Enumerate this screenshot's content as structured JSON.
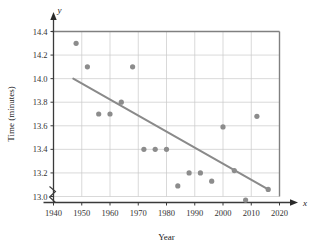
{
  "chart_data": {
    "type": "scatter",
    "title": "",
    "xlabel": "Year",
    "ylabel": "Time (minutes)",
    "x_axis_letter": "x",
    "y_axis_letter": "y",
    "xlim": [
      1940,
      2020
    ],
    "ylim": [
      13.0,
      14.4
    ],
    "xticks": [
      1940,
      1950,
      1960,
      1970,
      1980,
      1990,
      2000,
      2010,
      2020
    ],
    "xtick_labels": [
      "1940",
      "1950",
      "1960",
      "1970",
      "1980",
      "1990",
      "2000",
      "2010",
      "2020"
    ],
    "yticks": [
      13.0,
      13.2,
      13.4,
      13.6,
      13.8,
      14.0,
      14.2,
      14.4
    ],
    "ytick_labels": [
      "13.0",
      "13.2",
      "13.4",
      "13.6",
      "13.8",
      "14.0",
      "14.2",
      "14.4"
    ],
    "grid": true,
    "legend": null,
    "axis_break": true,
    "point_color": "#8c8c8c",
    "line_color": "#8a8a8a",
    "grid_color": "#c8c8c8",
    "frame_color": "#808080",
    "points": [
      {
        "x": 1948,
        "y": 14.3
      },
      {
        "x": 1952,
        "y": 14.1
      },
      {
        "x": 1956,
        "y": 13.7
      },
      {
        "x": 1960,
        "y": 13.7
      },
      {
        "x": 1964,
        "y": 13.8
      },
      {
        "x": 1968,
        "y": 14.1
      },
      {
        "x": 1972,
        "y": 13.4
      },
      {
        "x": 1976,
        "y": 13.4
      },
      {
        "x": 1980,
        "y": 13.4
      },
      {
        "x": 1984,
        "y": 13.09
      },
      {
        "x": 1988,
        "y": 13.2
      },
      {
        "x": 1992,
        "y": 13.2
      },
      {
        "x": 1996,
        "y": 13.13
      },
      {
        "x": 2000,
        "y": 13.59
      },
      {
        "x": 2004,
        "y": 13.22
      },
      {
        "x": 2008,
        "y": 12.97
      },
      {
        "x": 2012,
        "y": 13.68
      },
      {
        "x": 2016,
        "y": 13.06
      }
    ],
    "trend_line": {
      "x1": 1947,
      "y1": 14.0,
      "x2": 2016,
      "y2": 13.06
    }
  }
}
